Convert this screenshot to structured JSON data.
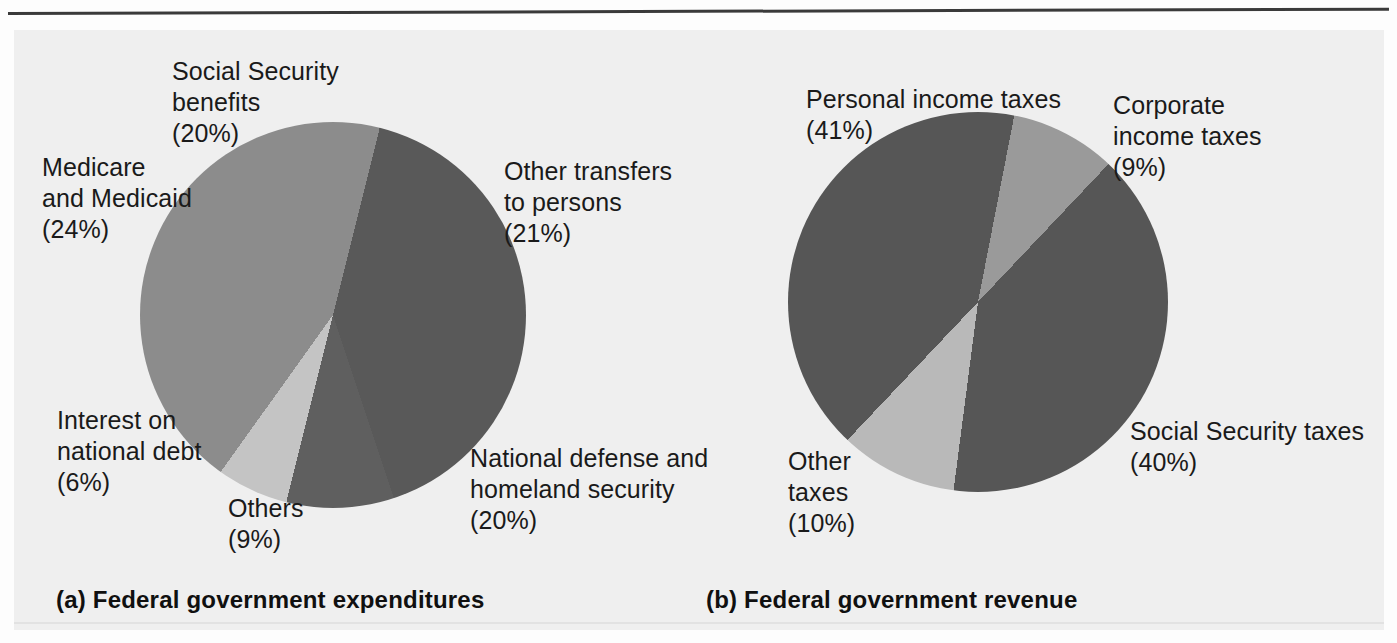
{
  "figure": {
    "background_color": "#efefef",
    "rule_color": "#3a3a3a"
  },
  "panels": [
    {
      "id": "a",
      "caption": "(a) Federal government expenditures",
      "labels": [
        {
          "name": "social-security-benefits",
          "text": "Social Security\nbenefits\n(20%)"
        },
        {
          "name": "medicare-and-medicaid",
          "text": "Medicare\nand Medicaid\n(24%)"
        },
        {
          "name": "other-transfers-to-persons",
          "text": "Other transfers\nto persons\n(21%)"
        },
        {
          "name": "interest-on-national-debt",
          "text": "Interest on\nnational debt\n(6%)"
        },
        {
          "name": "others",
          "text": "Others\n(9%)"
        },
        {
          "name": "national-defense",
          "text": "National defense and\nhomeland security\n(20%)"
        }
      ]
    },
    {
      "id": "b",
      "caption": "(b) Federal government revenue",
      "labels": [
        {
          "name": "personal-income-taxes",
          "text": "Personal income taxes\n(41%)"
        },
        {
          "name": "corporate-income-taxes",
          "text": "Corporate\nincome taxes\n(9%)"
        },
        {
          "name": "other-taxes",
          "text": "Other\ntaxes\n(10%)"
        },
        {
          "name": "social-security-taxes",
          "text": "Social Security taxes\n(40%)"
        }
      ]
    }
  ],
  "chart_data": [
    {
      "type": "pie",
      "title": "(a) Federal government expenditures",
      "start_angle_deg": 14,
      "direction": "clockwise",
      "categories": [
        "Other transfers to persons",
        "National defense and homeland security",
        "Others",
        "Interest on national debt",
        "Medicare and Medicaid",
        "Social Security benefits"
      ],
      "values": [
        21,
        20,
        9,
        6,
        24,
        20
      ],
      "unit": "percent",
      "colors": [
        "#595959",
        "#595959",
        "#5f5f5f",
        "#c4c4c4",
        "#8c8c8c",
        "#8c8c8c"
      ],
      "labels": [
        "Other transfers to persons (21%)",
        "National defense and homeland security (20%)",
        "Others (9%)",
        "Interest on national debt (6%)",
        "Medicare and Medicaid (24%)",
        "Social Security benefits (20%)"
      ],
      "legend": "none",
      "grid": false
    },
    {
      "type": "pie",
      "title": "(b) Federal government revenue",
      "start_angle_deg": 11,
      "direction": "clockwise",
      "categories": [
        "Corporate income taxes",
        "Social Security taxes",
        "Other taxes",
        "Personal income taxes"
      ],
      "values": [
        9,
        40,
        10,
        41
      ],
      "unit": "percent",
      "colors": [
        "#9a9a9a",
        "#565656",
        "#b9b9b9",
        "#565656"
      ],
      "labels": [
        "Corporate income taxes (9%)",
        "Social Security taxes (40%)",
        "Other taxes (10%)",
        "Personal income taxes (41%)"
      ],
      "legend": "none",
      "grid": false
    }
  ]
}
